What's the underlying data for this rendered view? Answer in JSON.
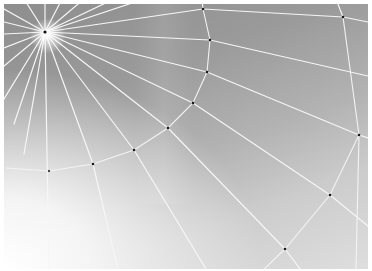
{
  "image": {
    "subject": "spider web close-up on grey gradient background",
    "colors": {
      "background_dark": "#8e8e8e",
      "background_light": "#f4f4f4",
      "silk": "#f6f6f6",
      "node": "#1a1a1a",
      "border": "#ffffff"
    },
    "hub": {
      "x": 41,
      "y": 28
    },
    "nodes": [
      {
        "x": 199,
        "y": 5
      },
      {
        "x": 206,
        "y": 36
      },
      {
        "x": 203,
        "y": 68
      },
      {
        "x": 189,
        "y": 99
      },
      {
        "x": 164,
        "y": 124
      },
      {
        "x": 130,
        "y": 146
      },
      {
        "x": 89,
        "y": 160
      },
      {
        "x": 45,
        "y": 167
      },
      {
        "x": 2,
        "y": 164
      },
      {
        "x": 339,
        "y": 13
      },
      {
        "x": 355,
        "y": 131
      },
      {
        "x": 326,
        "y": 191
      },
      {
        "x": 281,
        "y": 245
      }
    ]
  }
}
